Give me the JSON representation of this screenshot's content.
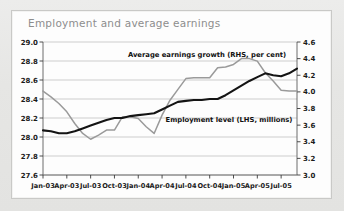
{
  "panel": {
    "background_color": "#fdfdfd",
    "outer_background_color": "#e9e9e7"
  },
  "chart_data": {
    "type": "line",
    "title": "Employment and average earnings",
    "title_color": "#8d8d8d",
    "xlabel": "",
    "ylabel": "",
    "grid": true,
    "legend_position": "inline-annotation",
    "x": [
      "Jan-03",
      "Feb-03",
      "Mar-03",
      "Apr-03",
      "May-03",
      "Jun-03",
      "Jul-03",
      "Aug-03",
      "Sep-03",
      "Oct-03",
      "Nov-03",
      "Dec-03",
      "Jan-04",
      "Feb-04",
      "Mar-04",
      "Apr-04",
      "May-04",
      "Jun-04",
      "Jul-04",
      "Aug-04",
      "Sep-04",
      "Oct-04",
      "Nov-04",
      "Dec-04",
      "Jan-05",
      "Feb-05",
      "Mar-05",
      "Apr-05",
      "May-05",
      "Jun-05",
      "Jul-05",
      "Aug-05",
      "Sep-05"
    ],
    "xtick_labels": [
      "Jan-03",
      "Apr-03",
      "Jul-03",
      "Oct-03",
      "Jan-04",
      "Apr-04",
      "Jul-04",
      "Oct-04",
      "Jan-05",
      "Apr-05",
      "Jul-05"
    ],
    "left_axis": {
      "label": "Employment level (LHS, millions)",
      "ylim": [
        27.6,
        29.0
      ],
      "ytick_labels": [
        "27.6",
        "27.8",
        "28.0",
        "28.2",
        "28.4",
        "28.6",
        "28.8",
        "29.0"
      ],
      "ytick_values": [
        27.6,
        27.8,
        28.0,
        28.2,
        28.4,
        28.6,
        28.8,
        29.0
      ]
    },
    "right_axis": {
      "label": "Average earnings growth (RHS, per cent)",
      "ylim": [
        3.0,
        4.6
      ],
      "ytick_labels": [
        "3.0",
        "3.2",
        "3.4",
        "3.6",
        "3.8",
        "4.0",
        "4.2",
        "4.4",
        "4.6"
      ],
      "ytick_values": [
        3.0,
        3.2,
        3.4,
        3.6,
        3.8,
        4.0,
        4.2,
        4.4,
        4.6
      ]
    },
    "series": [
      {
        "name": "Employment level (LHS, millions)",
        "axis": "left",
        "color": "#141414",
        "values": [
          28.07,
          28.06,
          28.04,
          28.04,
          28.06,
          28.09,
          28.12,
          28.15,
          28.18,
          28.2,
          28.2,
          28.22,
          28.23,
          28.24,
          28.25,
          28.29,
          28.33,
          28.37,
          28.38,
          28.39,
          28.39,
          28.4,
          28.4,
          28.44,
          28.49,
          28.54,
          28.59,
          28.63,
          28.67,
          28.65,
          28.64,
          28.67,
          28.72
        ]
      },
      {
        "name": "Average earnings growth (RHS, per cent)",
        "axis": "right",
        "color": "#9a9a9a",
        "values": [
          4.01,
          3.94,
          3.86,
          3.76,
          3.62,
          3.5,
          3.43,
          3.48,
          3.54,
          3.54,
          3.7,
          3.7,
          3.68,
          3.58,
          3.5,
          3.72,
          3.9,
          4.03,
          4.16,
          4.17,
          4.17,
          4.17,
          4.29,
          4.3,
          4.33,
          4.4,
          4.4,
          4.37,
          4.23,
          4.13,
          4.02,
          4.01,
          4.01
        ]
      }
    ],
    "annotations": [
      {
        "text": "Average earnings growth (RHS, per cent)",
        "target_series": "Average earnings growth (RHS, per cent)"
      },
      {
        "text": "Employment level (LHS, millions)",
        "target_series": "Employment level (LHS, millions)"
      }
    ]
  }
}
